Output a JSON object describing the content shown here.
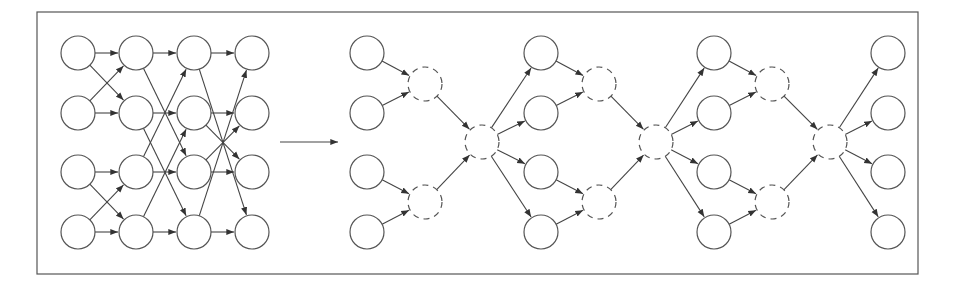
{
  "diagram": {
    "title": "",
    "colors": {
      "stroke": "#555555",
      "edge": "#444444",
      "background": "#ffffff"
    },
    "frame": {
      "x": 37,
      "y": 12,
      "width": 881,
      "height": 262
    },
    "node_radius": 17,
    "left_network": {
      "columns_x": [
        78,
        136,
        194,
        252
      ],
      "rows_y": [
        53,
        113,
        172,
        232
      ],
      "stages": [
        {
          "from_col": 0,
          "to_col": 1,
          "edges": [
            [
              0,
              0
            ],
            [
              0,
              1
            ],
            [
              1,
              0
            ],
            [
              1,
              1
            ],
            [
              2,
              2
            ],
            [
              2,
              3
            ],
            [
              3,
              2
            ],
            [
              3,
              3
            ]
          ]
        },
        {
          "from_col": 1,
          "to_col": 2,
          "edges": [
            [
              0,
              0
            ],
            [
              0,
              2
            ],
            [
              1,
              1
            ],
            [
              1,
              3
            ],
            [
              2,
              0
            ],
            [
              2,
              2
            ],
            [
              3,
              1
            ],
            [
              3,
              3
            ]
          ]
        },
        {
          "from_col": 2,
          "to_col": 3,
          "edges": [
            [
              0,
              0
            ],
            [
              0,
              3
            ],
            [
              1,
              1
            ],
            [
              1,
              2
            ],
            [
              2,
              1
            ],
            [
              2,
              2
            ],
            [
              3,
              0
            ],
            [
              3,
              3
            ]
          ]
        }
      ]
    },
    "transform_arrow": {
      "x1": 280,
      "y1": 142,
      "x2": 338,
      "y2": 142,
      "label": ""
    },
    "right_network": {
      "solid_columns_x": [
        367,
        541,
        714,
        888
      ],
      "rows_y": [
        53,
        113,
        172,
        232
      ],
      "merge_nodes": [
        {
          "x": 425,
          "y": 84
        },
        {
          "x": 425,
          "y": 202
        },
        {
          "x": 599,
          "y": 84
        },
        {
          "x": 599,
          "y": 202
        },
        {
          "x": 772,
          "y": 84
        },
        {
          "x": 772,
          "y": 202
        }
      ],
      "hub_nodes": [
        {
          "x": 482,
          "y": 142
        },
        {
          "x": 656,
          "y": 142
        },
        {
          "x": 830,
          "y": 142
        }
      ]
    }
  }
}
